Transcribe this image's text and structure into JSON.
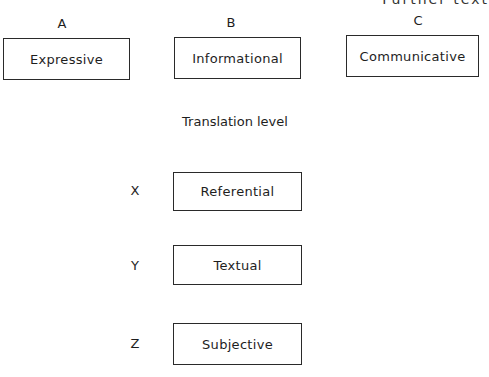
{
  "clipped_header": "Further text",
  "text_types": [
    {
      "letter": "A",
      "label": "Expressive"
    },
    {
      "letter": "B",
      "label": "Informational"
    },
    {
      "letter": "C",
      "label": "Communicative"
    }
  ],
  "section_title": "Translation level",
  "levels": [
    {
      "letter": "X",
      "label": "Referential"
    },
    {
      "letter": "Y",
      "label": "Textual"
    },
    {
      "letter": "Z",
      "label": "Subjective"
    }
  ]
}
